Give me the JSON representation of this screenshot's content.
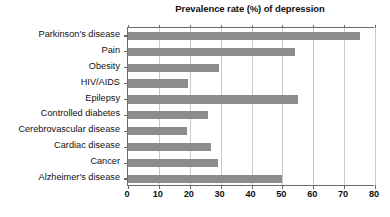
{
  "chart_data": {
    "type": "bar",
    "orientation": "horizontal",
    "title": "Prevalence rate (%) of depression",
    "xlabel": "",
    "ylabel": "",
    "xlim": [
      0,
      80
    ],
    "xticks": [
      "0",
      "10",
      "20",
      "30",
      "40",
      "50",
      "60",
      "70",
      "80"
    ],
    "xtick_values": [
      0,
      10,
      20,
      30,
      40,
      50,
      60,
      70,
      80
    ],
    "grid": "vertical",
    "legend": "none",
    "bar_color": "#8c8c8c",
    "axis_color": "#6b6b6b",
    "gridline_color": "#c9c9c9",
    "background": "#ffffff",
    "categories": [
      "Parkinson's disease",
      "Pain",
      "Obesity",
      "HIV/AIDS",
      "Epilepsy",
      "Controlled diabetes",
      "Cerebrovascular disease",
      "Cardiac disease",
      "Cancer",
      "Alzheimer's disease"
    ],
    "values": [
      75,
      54,
      29.5,
      19.5,
      55,
      26,
      19,
      27,
      29,
      50
    ]
  }
}
